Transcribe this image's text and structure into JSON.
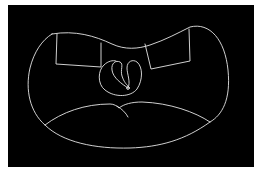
{
  "figure": {
    "background": "#000000",
    "stroke_color": "#e6e6e6",
    "shapes": [
      {
        "name": "outer-contour"
      },
      {
        "name": "left-rectangle"
      },
      {
        "name": "right-rectangle"
      },
      {
        "name": "central-loop"
      },
      {
        "name": "lower-curve"
      },
      {
        "name": "lower-curve-tail"
      },
      {
        "name": "center-dot"
      }
    ]
  },
  "caption": {
    "text": ""
  }
}
